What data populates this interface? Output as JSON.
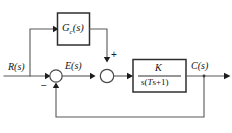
{
  "diagram": {
    "type": "control-system-block-diagram",
    "signals": {
      "input": "R(s)",
      "error": "E(s)",
      "output": "C(s)"
    },
    "blocks": [
      {
        "id": "compensator",
        "label": "G",
        "subscript": "c",
        "argument": "(s)",
        "full_label": "Gc(s)",
        "role": "feedforward-compensator"
      },
      {
        "id": "plant",
        "numerator": "K",
        "denominator_prefix": "s(",
        "denominator_var": "T",
        "denominator_suffix": "s+1)",
        "full_label": "K / s(Ts+1)",
        "role": "plant-transfer-function"
      }
    ],
    "summing_junctions": [
      {
        "id": "error-summer",
        "signs": [
          "+",
          "-"
        ],
        "visible_sign": "−",
        "inputs": [
          "R(s)",
          "feedback C(s)"
        ],
        "output": "E(s)"
      },
      {
        "id": "feedforward-summer",
        "signs": [
          "+",
          "+"
        ],
        "visible_sign": "+",
        "inputs": [
          "E(s)",
          "Gc(s) output"
        ],
        "output": "plant input"
      }
    ],
    "feedback": {
      "type": "unity",
      "gain": "1",
      "from": "C(s)",
      "to": "error-summer"
    },
    "colors": {
      "wire": "#58585a",
      "block_border": "#2f2f31",
      "text": "#141416",
      "background": "#ffffff"
    }
  }
}
